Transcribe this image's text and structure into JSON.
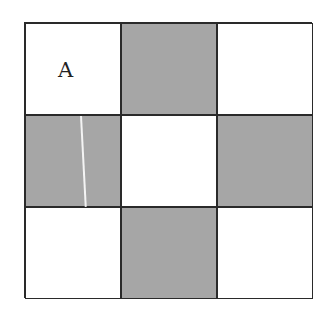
{
  "grid": {
    "rows": 3,
    "cols": 3,
    "colors": {
      "shaded": "#a6a6a6",
      "blank": "#ffffff",
      "border": "#2a2a2a"
    },
    "cells": [
      [
        "white",
        "gray",
        "white"
      ],
      [
        "gray",
        "white",
        "gray"
      ],
      [
        "white",
        "gray",
        "white"
      ]
    ],
    "label": {
      "text": "A",
      "row": 0,
      "col": 0
    }
  }
}
